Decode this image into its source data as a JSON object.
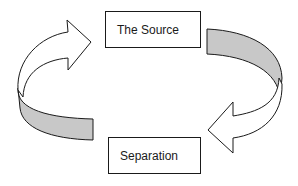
{
  "diagram": {
    "type": "cycle",
    "nodes": [
      {
        "id": "source",
        "label": "The Source"
      },
      {
        "id": "separation",
        "label": "Separation"
      }
    ],
    "edges": [
      {
        "from": "separation",
        "to": "source",
        "style": "curved-arrow-left-side"
      },
      {
        "from": "source",
        "to": "separation",
        "style": "curved-arrow-right-side"
      }
    ],
    "colors": {
      "stroke": "#1a1a1a",
      "arrow_fill": "#ffffff",
      "band_fill": "#c8c8c8",
      "background": "#ffffff"
    }
  }
}
